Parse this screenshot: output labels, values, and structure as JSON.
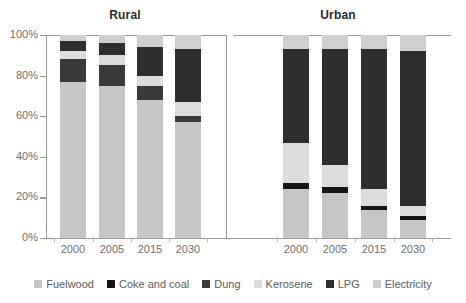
{
  "chart_data": {
    "type": "bar",
    "subtype": "stacked-percentage",
    "title": "",
    "panels": [
      {
        "name": "Rural",
        "label": "Rural"
      },
      {
        "name": "Urban",
        "label": "Urban"
      }
    ],
    "categories": [
      "2000",
      "2005",
      "2015",
      "2030"
    ],
    "series_names": [
      "Fuelwood",
      "Coke and coal",
      "Dung",
      "Kerosene",
      "LPG",
      "Electricity"
    ],
    "series_colors": [
      "#c6c6c6",
      "#151515",
      "#3a3a3a",
      "#dcdcdc",
      "#2e2e2e",
      "#cfcfcf"
    ],
    "xlabel": "",
    "ylabel": "",
    "ylim": [
      0,
      100
    ],
    "yticks": [
      0,
      20,
      40,
      60,
      80,
      100
    ],
    "ytick_labels": [
      "0%",
      "20%",
      "40%",
      "60%",
      "80%",
      "100%"
    ],
    "grid": false,
    "legend_position": "bottom",
    "units": "percent",
    "rural": {
      "series": [
        {
          "name": "Fuelwood",
          "values": [
            77,
            75,
            68,
            57
          ]
        },
        {
          "name": "Coke and coal",
          "values": [
            0,
            0,
            0,
            0
          ]
        },
        {
          "name": "Dung",
          "values": [
            11,
            10,
            7,
            3
          ]
        },
        {
          "name": "Kerosene",
          "values": [
            4,
            5,
            5,
            7
          ]
        },
        {
          "name": "LPG",
          "values": [
            5,
            6,
            14,
            26
          ]
        },
        {
          "name": "Electricity",
          "values": [
            3,
            4,
            6,
            7
          ]
        }
      ]
    },
    "urban": {
      "series": [
        {
          "name": "Fuelwood",
          "values": [
            24,
            22,
            14,
            9
          ]
        },
        {
          "name": "Coke and coal",
          "values": [
            3,
            3,
            2,
            2
          ]
        },
        {
          "name": "Dung",
          "values": [
            0,
            0,
            0,
            0
          ]
        },
        {
          "name": "Kerosene",
          "values": [
            20,
            11,
            8,
            5
          ]
        },
        {
          "name": "LPG",
          "values": [
            46,
            57,
            69,
            76
          ]
        },
        {
          "name": "Electricity",
          "values": [
            7,
            7,
            7,
            8
          ]
        }
      ]
    }
  },
  "panel_titles": {
    "rural": "Rural",
    "urban": "Urban"
  },
  "legend": {
    "items": [
      {
        "label": "Fuelwood",
        "color": "#c6c6c6"
      },
      {
        "label": "Coke and coal",
        "color": "#151515"
      },
      {
        "label": "Dung",
        "color": "#3a3a3a"
      },
      {
        "label": "Kerosene",
        "color": "#dcdcdc"
      },
      {
        "label": "LPG",
        "color": "#2e2e2e"
      },
      {
        "label": "Electricity",
        "color": "#cfcfcf"
      }
    ]
  },
  "axis": {
    "y_tick_labels": [
      "100%",
      "80%",
      "60%",
      "40%",
      "20%",
      "0%"
    ],
    "x_tick_labels_rural": [
      "2000",
      "2005",
      "2015",
      "2030"
    ],
    "x_tick_labels_urban": [
      "2000",
      "2005",
      "2015",
      "2030"
    ]
  }
}
